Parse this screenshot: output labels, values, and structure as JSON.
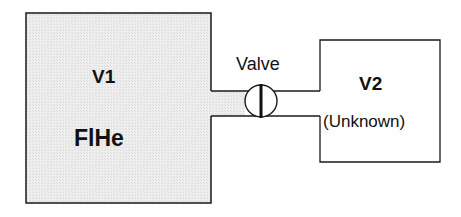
{
  "diagram": {
    "vessel1": {
      "name": "V1",
      "content": "FlHe",
      "fill": "#ececec"
    },
    "vessel2": {
      "name": "V2",
      "content": "(Unknown)",
      "fill": "#ffffff"
    },
    "valve": {
      "label": "Valve"
    },
    "line_color": "#1a1a1a"
  }
}
